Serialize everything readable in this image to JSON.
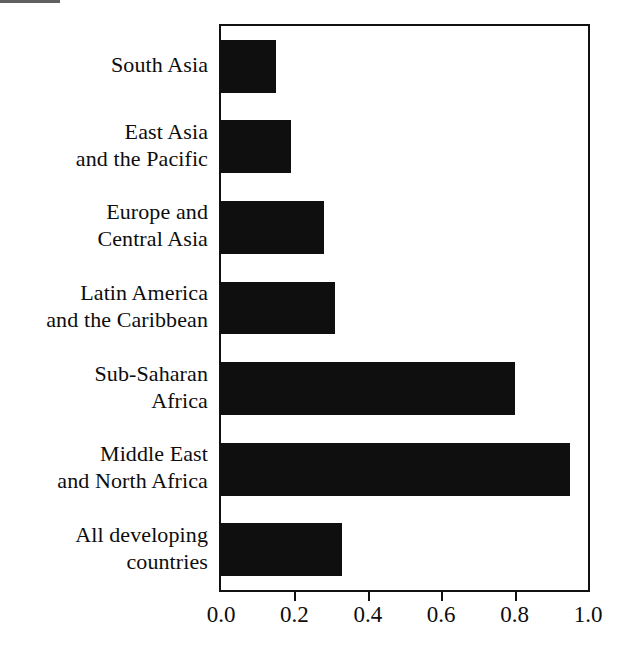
{
  "chart_data": {
    "type": "bar",
    "orientation": "horizontal",
    "title": "",
    "subtitle": "",
    "xlabel": "",
    "ylabel": "",
    "xlim": [
      0.0,
      1.0
    ],
    "xticks": [
      "0.0",
      "0.2",
      "0.4",
      "0.6",
      "0.8",
      "1.0"
    ],
    "xtick_values": [
      0.0,
      0.2,
      0.4,
      0.6,
      0.8,
      1.0
    ],
    "grid": false,
    "legend": null,
    "bar_color": "#100f0f",
    "frame_color": "#111111",
    "background": "#ffffff",
    "categories": [
      "South Asia",
      "East Asia and the Pacific",
      "Europe and Central Asia",
      "Latin America and the Caribbean",
      "Sub-Saharan Africa",
      "Middle East and North Africa",
      "All developing countries"
    ],
    "values": [
      0.15,
      0.19,
      0.28,
      0.31,
      0.8,
      0.95,
      0.33
    ],
    "bars": [
      {
        "label_lines": [
          "South Asia"
        ],
        "value": 0.15
      },
      {
        "label_lines": [
          "East Asia",
          "and the Pacific"
        ],
        "value": 0.19
      },
      {
        "label_lines": [
          "Europe and",
          "Central Asia"
        ],
        "value": 0.28
      },
      {
        "label_lines": [
          "Latin America",
          "and the Caribbean"
        ],
        "value": 0.31
      },
      {
        "label_lines": [
          "Sub-Saharan",
          "Africa"
        ],
        "value": 0.8
      },
      {
        "label_lines": [
          "Middle East",
          "and North Africa"
        ],
        "value": 0.95
      },
      {
        "label_lines": [
          "All developing",
          "countries"
        ],
        "value": 0.33
      }
    ]
  }
}
